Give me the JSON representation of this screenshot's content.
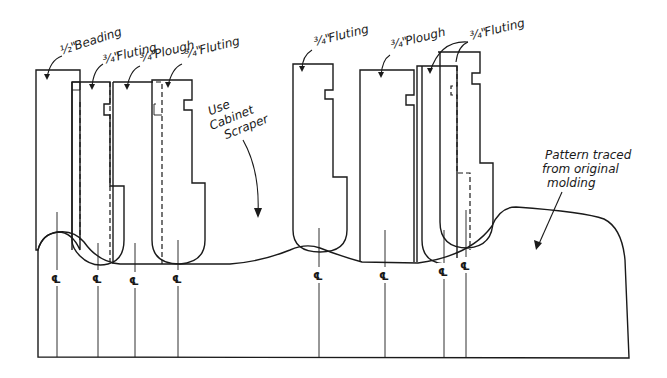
{
  "figure": {
    "type": "technical-drawing"
  },
  "labels": {
    "beading": "1/2\" Beading",
    "beading_frac": "½\"",
    "beading_word": "Beading",
    "fluting1_frac": "¾\"",
    "fluting1_word": "Fluting",
    "plough1_frac": "¾\"",
    "plough1_word": "Plough",
    "fluting2_frac": "¾\"",
    "fluting2_word": "Fluting",
    "fluting3_frac": "¾\"",
    "fluting3_word": "Fluting",
    "plough2_frac": "¾\"",
    "plough2_word": "Plough",
    "fluting4_frac": "¾\"",
    "fluting4_word": "Fluting",
    "scraper_line1": "Use",
    "scraper_line2": "Cabinet",
    "scraper_line3": "Scraper",
    "pattern_line1": "Pattern traced",
    "pattern_line2": "from original",
    "pattern_line3": "molding"
  },
  "centerline_symbol": "℄",
  "centerlines": [
    {
      "id": "cl-1",
      "x": 57
    },
    {
      "id": "cl-2",
      "x": 98
    },
    {
      "id": "cl-3",
      "x": 135
    },
    {
      "id": "cl-4",
      "x": 178
    },
    {
      "id": "cl-5",
      "x": 319
    },
    {
      "id": "cl-6",
      "x": 385
    },
    {
      "id": "cl-7",
      "x": 444
    },
    {
      "id": "cl-8",
      "x": 466
    }
  ],
  "cutters": [
    {
      "name": "1/2 inch beading",
      "size": "½\""
    },
    {
      "name": "3/4 inch fluting",
      "size": "¾\""
    },
    {
      "name": "3/4 inch plough",
      "size": "¾\""
    },
    {
      "name": "3/4 inch fluting",
      "size": "¾\""
    },
    {
      "name": "3/4 inch fluting",
      "size": "¾\""
    },
    {
      "name": "3/4 inch plough",
      "size": "¾\""
    },
    {
      "name": "3/4 inch fluting",
      "size": "¾\""
    }
  ]
}
